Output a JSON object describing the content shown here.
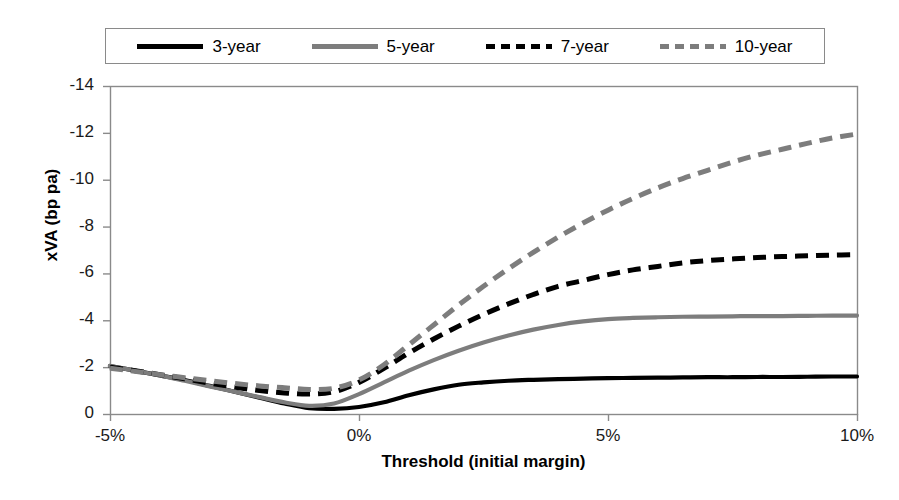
{
  "chart_data": {
    "type": "line",
    "title": "",
    "xlabel": "Threshold (initial margin)",
    "ylabel": "xVA (bp pa)",
    "xlim": [
      -5,
      10
    ],
    "ylim": [
      0,
      -14
    ],
    "y_inverted": true,
    "grid": false,
    "legend_position": "top",
    "x_tick_labels": [
      "-5%",
      "0%",
      "5%",
      "10%"
    ],
    "x_tick_values": [
      -5,
      0,
      5,
      10
    ],
    "y_tick_labels": [
      "-14",
      "-12",
      "-10",
      "-8",
      "-6",
      "-4",
      "-2",
      "0"
    ],
    "y_tick_values": [
      -14,
      -12,
      -10,
      -8,
      -6,
      -4,
      -2,
      0
    ],
    "x": [
      -5,
      -4.5,
      -4,
      -3.5,
      -3,
      -2.5,
      -2,
      -1.5,
      -1,
      -0.5,
      0,
      0.5,
      1,
      1.5,
      2,
      2.5,
      3,
      3.5,
      4,
      4.5,
      5,
      5.5,
      6,
      6.5,
      7,
      7.5,
      8,
      8.5,
      9,
      9.5,
      10
    ],
    "series": [
      {
        "name": "3-year",
        "color": "#000000",
        "style": "solid",
        "values": [
          -2.05,
          -1.85,
          -1.65,
          -1.45,
          -1.2,
          -0.95,
          -0.7,
          -0.45,
          -0.25,
          -0.22,
          -0.3,
          -0.5,
          -0.8,
          -1.05,
          -1.25,
          -1.35,
          -1.42,
          -1.46,
          -1.49,
          -1.51,
          -1.53,
          -1.54,
          -1.55,
          -1.56,
          -1.57,
          -1.57,
          -1.58,
          -1.58,
          -1.59,
          -1.6,
          -1.6
        ]
      },
      {
        "name": "5-year",
        "color": "#7d7d7d",
        "style": "solid",
        "values": [
          -2.05,
          -1.85,
          -1.65,
          -1.42,
          -1.18,
          -0.95,
          -0.72,
          -0.5,
          -0.35,
          -0.45,
          -0.85,
          -1.35,
          -1.85,
          -2.3,
          -2.7,
          -3.05,
          -3.35,
          -3.6,
          -3.8,
          -3.95,
          -4.05,
          -4.1,
          -4.13,
          -4.15,
          -4.16,
          -4.17,
          -4.18,
          -4.18,
          -4.19,
          -4.2,
          -4.2
        ]
      },
      {
        "name": "7-year",
        "color": "#000000",
        "style": "dashed",
        "values": [
          -2.0,
          -1.85,
          -1.68,
          -1.5,
          -1.32,
          -1.15,
          -1.0,
          -0.9,
          -0.85,
          -0.95,
          -1.35,
          -1.95,
          -2.6,
          -3.2,
          -3.75,
          -4.25,
          -4.7,
          -5.1,
          -5.45,
          -5.7,
          -5.95,
          -6.15,
          -6.3,
          -6.45,
          -6.55,
          -6.62,
          -6.68,
          -6.72,
          -6.75,
          -6.78,
          -6.8
        ]
      },
      {
        "name": "10-year",
        "color": "#7d7d7d",
        "style": "dashed",
        "values": [
          -1.95,
          -1.82,
          -1.68,
          -1.55,
          -1.42,
          -1.3,
          -1.2,
          -1.12,
          -1.05,
          -1.1,
          -1.45,
          -2.1,
          -2.95,
          -3.8,
          -4.65,
          -5.45,
          -6.2,
          -6.9,
          -7.55,
          -8.15,
          -8.7,
          -9.2,
          -9.65,
          -10.05,
          -10.4,
          -10.75,
          -11.05,
          -11.3,
          -11.55,
          -11.78,
          -11.95
        ]
      }
    ]
  },
  "legend": {
    "items": [
      {
        "label": "3-year"
      },
      {
        "label": "5-year"
      },
      {
        "label": "7-year"
      },
      {
        "label": "10-year"
      }
    ]
  },
  "axes": {
    "x_title": "Threshold (initial margin)",
    "y_title": "xVA (bp pa)"
  },
  "colors": {
    "black": "#000000",
    "gray": "#7d7d7d",
    "axis": "#8a8a8a",
    "background": "#ffffff"
  }
}
